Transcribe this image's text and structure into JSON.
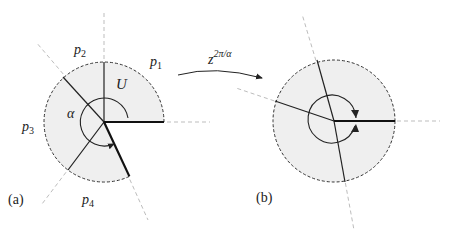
{
  "panels": {
    "a": {
      "caption": "(a)",
      "labels": {
        "p1": "p",
        "p1_sub": "1",
        "p2": "p",
        "p2_sub": "2",
        "p3": "p",
        "p3_sub": "3",
        "p4": "p",
        "p4_sub": "4",
        "region": "U",
        "angle": "α"
      }
    },
    "b": {
      "caption": "(b)"
    }
  },
  "map": {
    "base": "z",
    "exponent": "2π/α"
  },
  "colors": {
    "fill": "#efefef",
    "stroke": "#222222",
    "dashed_ray": "#b8b8b8"
  }
}
